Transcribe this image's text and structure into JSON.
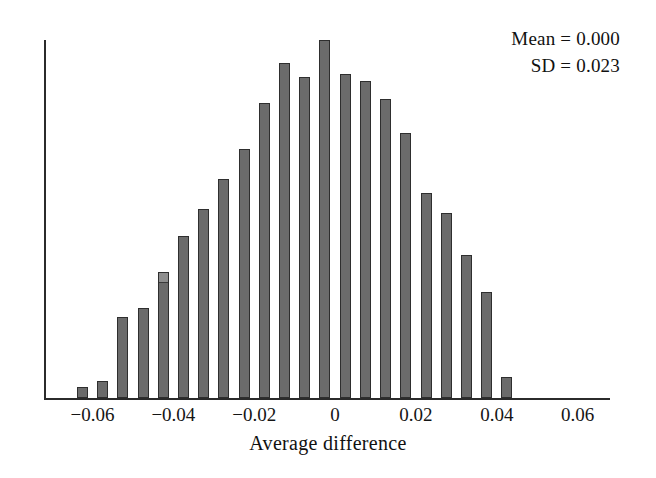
{
  "chart_data": {
    "type": "bar",
    "title": "",
    "subtitle": "",
    "xlabel": "Average difference",
    "ylabel": "",
    "xlim": [
      -0.072,
      0.068
    ],
    "ylim": [
      0,
      1.0
    ],
    "grid": false,
    "legend": null,
    "bin_width": 0.005,
    "annotations": [
      {
        "label": "Mean = 0.000"
      },
      {
        "label": "SD = 0.023"
      }
    ],
    "x_tick_labels": [
      "−0.06",
      "−0.04",
      "−0.02",
      "0",
      "0.02",
      "0.04",
      "0.06"
    ],
    "x_tick_values": [
      -0.06,
      -0.04,
      -0.02,
      0,
      0.02,
      0.04,
      0.06
    ],
    "y_tick_labels": [],
    "bar_color": "#6b6b6b",
    "bar_edge_color": "#2e2e2e",
    "axis_color": "#2b2b2b",
    "background_color": "#ffffff",
    "categories": [
      "-0.0625",
      "-0.0575",
      "-0.0525",
      "-0.0475",
      "-0.0425",
      "-0.0375",
      "-0.0325",
      "-0.0275",
      "-0.0225",
      "-0.0175",
      "-0.0125",
      "-0.0075",
      "-0.0025",
      "0.0025",
      "0.0075",
      "0.0125",
      "0.0175",
      "0.0225",
      "0.0275",
      "0.0325",
      "0.0375",
      "0.0425"
    ],
    "values": [
      0.031,
      0.047,
      0.226,
      0.251,
      0.351,
      0.452,
      0.528,
      0.611,
      0.695,
      0.824,
      0.936,
      0.896,
      1.0,
      0.905,
      0.885,
      0.835,
      0.741,
      0.572,
      0.516,
      0.4,
      0.296,
      0.059
    ],
    "bar_artifacts": [
      {
        "index": 4,
        "type": "light-cap",
        "color": "#8e8e8e"
      }
    ]
  }
}
